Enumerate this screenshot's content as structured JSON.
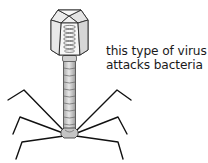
{
  "diagram": {
    "caption_lines": [
      "this type of virus",
      "attacks bacteria"
    ],
    "parts": [
      "head-capsid",
      "dna-coil",
      "collar",
      "tail-sheath",
      "baseplate",
      "tail-fibers"
    ],
    "colors": {
      "outline": "#2a2a2a",
      "capsid_fill": "#f4f4f4",
      "capsid_shade": "#dcdcdc",
      "tail_fill": "#c8c8c8",
      "tail_highlight": "#e6e6e6",
      "fiber": "#111111",
      "text": "#1a1a1a"
    }
  }
}
